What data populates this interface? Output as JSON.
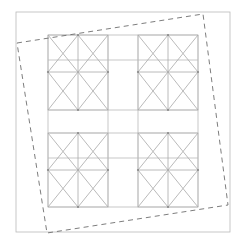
{
  "figure": {
    "title": "",
    "width": 246,
    "height": 248,
    "background_color": "#ffffff",
    "styles": {
      "solid_stroke_color": "#b9b9b9",
      "solid_stroke_width": 0.8,
      "diagonal_stroke_color": "#a8a8a8",
      "diagonal_stroke_width": 0.8,
      "dashed_stroke_color": "#6e6e6e",
      "dashed_stroke_width": 0.9,
      "dash_pattern": "5 4",
      "vertex_dot_color": "#8a8a8a",
      "vertex_dot_radius": 1.1
    },
    "outer_frame": {
      "name": "outer-rectangle",
      "x": 16,
      "y": 12,
      "width": 214,
      "height": 220
    },
    "grid": {
      "vertical_lines_x": [
        48,
        108,
        138,
        198
      ],
      "horizontal_lines_y": [
        35,
        60,
        110,
        133,
        158,
        207
      ],
      "vertical_span": [
        35,
        207
      ],
      "horizontal_span": [
        48,
        198
      ]
    },
    "tiles": [
      {
        "name": "tile-top-left",
        "x": 48,
        "y": 35,
        "width": 60,
        "height": 75,
        "center_x": 78,
        "center_y": 72,
        "diamond_points": "78,35 108,72 78,110 48,72",
        "diagonals": [
          {
            "x1": 48,
            "y1": 35,
            "x2": 78,
            "y2": 72
          },
          {
            "x1": 108,
            "y1": 35,
            "x2": 78,
            "y2": 72
          },
          {
            "x1": 48,
            "y1": 110,
            "x2": 78,
            "y2": 72
          },
          {
            "x1": 108,
            "y1": 110,
            "x2": 78,
            "y2": 72
          }
        ],
        "midline_h": {
          "x1": 48,
          "y1": 72,
          "x2": 108,
          "y2": 72
        },
        "midline_v": {
          "x1": 78,
          "y1": 35,
          "x2": 78,
          "y2": 110
        },
        "vertices": [
          {
            "x": 78,
            "y": 35
          },
          {
            "x": 108,
            "y": 72
          },
          {
            "x": 78,
            "y": 110
          },
          {
            "x": 48,
            "y": 72
          }
        ]
      },
      {
        "name": "tile-top-right",
        "x": 138,
        "y": 35,
        "width": 60,
        "height": 75,
        "center_x": 168,
        "center_y": 72,
        "diamond_points": "168,35 198,72 168,110 138,72",
        "diagonals": [
          {
            "x1": 138,
            "y1": 35,
            "x2": 168,
            "y2": 72
          },
          {
            "x1": 198,
            "y1": 35,
            "x2": 168,
            "y2": 72
          },
          {
            "x1": 138,
            "y1": 110,
            "x2": 168,
            "y2": 72
          },
          {
            "x1": 198,
            "y1": 110,
            "x2": 168,
            "y2": 72
          }
        ],
        "midline_h": {
          "x1": 138,
          "y1": 72,
          "x2": 198,
          "y2": 72
        },
        "midline_v": {
          "x1": 168,
          "y1": 35,
          "x2": 168,
          "y2": 110
        },
        "vertices": [
          {
            "x": 168,
            "y": 35
          },
          {
            "x": 198,
            "y": 72
          },
          {
            "x": 168,
            "y": 110
          },
          {
            "x": 138,
            "y": 72
          }
        ]
      },
      {
        "name": "tile-bottom-left",
        "x": 48,
        "y": 133,
        "width": 60,
        "height": 74,
        "center_x": 78,
        "center_y": 170,
        "diamond_points": "78,133 108,170 78,207 48,170",
        "diagonals": [
          {
            "x1": 48,
            "y1": 133,
            "x2": 78,
            "y2": 170
          },
          {
            "x1": 108,
            "y1": 133,
            "x2": 78,
            "y2": 170
          },
          {
            "x1": 48,
            "y1": 207,
            "x2": 78,
            "y2": 170
          },
          {
            "x1": 108,
            "y1": 207,
            "x2": 78,
            "y2": 170
          }
        ],
        "midline_h": {
          "x1": 48,
          "y1": 170,
          "x2": 108,
          "y2": 170
        },
        "midline_v": {
          "x1": 78,
          "y1": 133,
          "x2": 78,
          "y2": 207
        },
        "vertices": [
          {
            "x": 78,
            "y": 133
          },
          {
            "x": 108,
            "y": 170
          },
          {
            "x": 78,
            "y": 207
          },
          {
            "x": 48,
            "y": 170
          }
        ]
      },
      {
        "name": "tile-bottom-right",
        "x": 138,
        "y": 133,
        "width": 60,
        "height": 74,
        "center_x": 168,
        "center_y": 170,
        "diamond_points": "168,133 198,170 168,207 138,170",
        "diagonals": [
          {
            "x1": 138,
            "y1": 133,
            "x2": 168,
            "y2": 170
          },
          {
            "x1": 198,
            "y1": 133,
            "x2": 168,
            "y2": 170
          },
          {
            "x1": 138,
            "y1": 207,
            "x2": 168,
            "y2": 170
          },
          {
            "x1": 198,
            "y1": 207,
            "x2": 168,
            "y2": 170
          }
        ],
        "midline_h": {
          "x1": 138,
          "y1": 170,
          "x2": 198,
          "y2": 170
        },
        "midline_v": {
          "x1": 168,
          "y1": 133,
          "x2": 168,
          "y2": 207
        },
        "vertices": [
          {
            "x": 168,
            "y": 133
          },
          {
            "x": 198,
            "y": 170
          },
          {
            "x": 168,
            "y": 207
          },
          {
            "x": 138,
            "y": 170
          }
        ]
      }
    ],
    "dashed_quad": {
      "name": "dashed-quadrilateral",
      "points": "17,43 203,14 228,205 47,233",
      "corners": [
        {
          "label": "top-left",
          "x": 17,
          "y": 43
        },
        {
          "label": "top-right",
          "x": 203,
          "y": 14
        },
        {
          "label": "bottom-right",
          "x": 228,
          "y": 205
        },
        {
          "label": "bottom-left",
          "x": 47,
          "y": 233
        }
      ]
    }
  }
}
